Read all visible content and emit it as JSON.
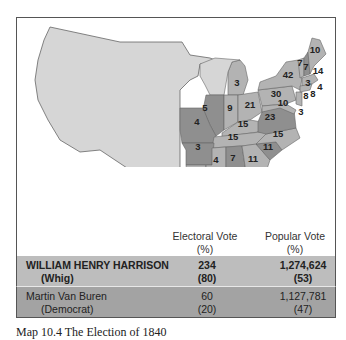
{
  "map": {
    "colors": {
      "territory": "#d6d6d6",
      "whig": "#b3b3b3",
      "democrat": "#8f8f8f",
      "border": "#555555"
    },
    "state_labels": [
      {
        "value": "10",
        "x": 315,
        "y": 53
      },
      {
        "value": "7",
        "x": 300,
        "y": 66
      },
      {
        "value": "7",
        "x": 306,
        "y": 70
      },
      {
        "value": "14",
        "x": 318,
        "y": 74
      },
      {
        "value": "42",
        "x": 288,
        "y": 78
      },
      {
        "value": "3",
        "x": 308,
        "y": 86
      },
      {
        "value": "4",
        "x": 320,
        "y": 90
      },
      {
        "value": "8",
        "x": 306,
        "y": 99
      },
      {
        "value": "8",
        "x": 313,
        "y": 97
      },
      {
        "value": "30",
        "x": 276,
        "y": 97
      },
      {
        "value": "10",
        "x": 283,
        "y": 106
      },
      {
        "value": "3",
        "x": 301,
        "y": 115
      },
      {
        "value": "3",
        "x": 237,
        "y": 86
      },
      {
        "value": "5",
        "x": 205,
        "y": 111
      },
      {
        "value": "9",
        "x": 230,
        "y": 111
      },
      {
        "value": "21",
        "x": 250,
        "y": 108
      },
      {
        "value": "23",
        "x": 270,
        "y": 120
      },
      {
        "value": "4",
        "x": 197,
        "y": 125
      },
      {
        "value": "15",
        "x": 243,
        "y": 127
      },
      {
        "value": "15",
        "x": 233,
        "y": 140
      },
      {
        "value": "15",
        "x": 278,
        "y": 137
      },
      {
        "value": "3",
        "x": 198,
        "y": 150
      },
      {
        "value": "11",
        "x": 268,
        "y": 150
      },
      {
        "value": "4",
        "x": 216,
        "y": 163
      },
      {
        "value": "7",
        "x": 233,
        "y": 161
      },
      {
        "value": "11",
        "x": 253,
        "y": 162
      },
      {
        "value": "5",
        "x": 199,
        "y": 179
      }
    ]
  },
  "table": {
    "headers": [
      {
        "line1": "Electoral Vote",
        "line2": "(%)"
      },
      {
        "line1": "Popular Vote",
        "line2": "(%)"
      }
    ],
    "rows": [
      {
        "candidate": "WILLIAM HENRY HARRISON",
        "party": "(Whig)",
        "electoral": "234",
        "electoral_pct": "(80)",
        "popular": "1,274,624",
        "popular_pct": "(53)",
        "winner": true
      },
      {
        "candidate": "Martin Van Buren",
        "party": "(Democrat)",
        "electoral": "60",
        "electoral_pct": "(20)",
        "popular": "1,127,781",
        "popular_pct": "(47)",
        "winner": false
      }
    ]
  },
  "caption": "Map 10.4 The Election of 1840"
}
